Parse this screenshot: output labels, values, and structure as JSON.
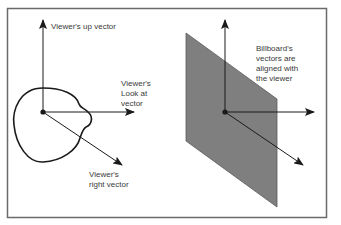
{
  "diagram": {
    "left_panel": {
      "labels": {
        "up": "Viewer's up vector",
        "look_at": [
          "Viewer's",
          "Look at",
          "vector"
        ],
        "right": [
          "Viewer's",
          "right vector"
        ]
      }
    },
    "right_panel": {
      "note": [
        "Billboard's",
        "vectors are",
        "aligned with",
        "the viewer"
      ]
    },
    "colors": {
      "frame": "#6a6a6a",
      "stroke": "#1a1a1a",
      "billboard_fill": "#7f7f7f",
      "text": "#3a3a3a"
    }
  }
}
